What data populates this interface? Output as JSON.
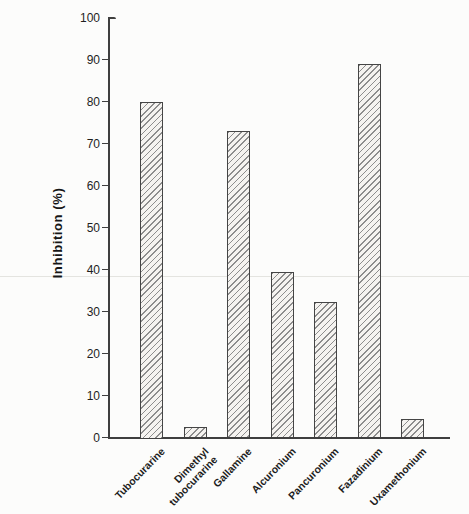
{
  "chart_data": {
    "type": "bar",
    "title": "",
    "xlabel": "",
    "ylabel": "Inhibition (%)",
    "ylim": [
      0,
      100
    ],
    "yticks": [
      0,
      10,
      20,
      30,
      40,
      50,
      60,
      70,
      80,
      90,
      100
    ],
    "categories": [
      "Tubocurarine",
      "Dimethyl\ntubocurarine",
      "Gallamine",
      "Alcuronium",
      "Pancuronium",
      "Fazadinium",
      "Uxamethonium"
    ],
    "values": [
      80,
      2.6,
      73,
      39.3,
      32.2,
      88.9,
      4.5
    ],
    "grid": "off",
    "legend": "none",
    "bar_style": "diagonal-hatch",
    "colors": {
      "axis": "#3f3f3f",
      "hatch": "#8d8d8d",
      "bar_fill": "#f5f3f0",
      "background": "#fcfcfb",
      "artifact_line": "#e4e4e0",
      "text": "#1e1e1e"
    }
  }
}
